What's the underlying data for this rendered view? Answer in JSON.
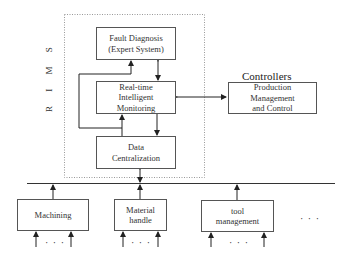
{
  "diagram": {
    "group_label": "R I M S",
    "boxes": {
      "fault_diagnosis": "Fault Diagnosis\n(Expert System)",
      "realtime_monitoring": "Real-time\nIntelligent\nMonitoring",
      "data_centralization": "Data\nCentralization",
      "production_mgmt": "Production\nManagement\nand Control",
      "machining": "Machining",
      "material_handle": "Material\nhandle",
      "tool_management": "tool\nmanagement"
    },
    "controllers_label": "Controllers",
    "ellipsis": "· · ·"
  }
}
